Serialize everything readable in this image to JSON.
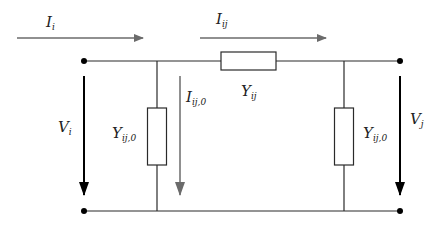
{
  "colors": {
    "wire": "#2a2a2a",
    "voltage_arrow": "#000000",
    "current_arrow": "#6b6b6b",
    "element_fill": "#ffffff"
  },
  "labels": {
    "current_in": {
      "main": "I",
      "sub": "i"
    },
    "current_series": {
      "main": "I",
      "sub": "ij"
    },
    "current_shunt": {
      "main": "I",
      "sub": "ij,0"
    },
    "series_admittance": {
      "main": "Y",
      "sub": "ij"
    },
    "shunt_admittance_left": {
      "main": "Y",
      "sub": "ij,0"
    },
    "shunt_admittance_right": {
      "main": "Y",
      "sub": "ij,0"
    },
    "voltage_left": {
      "main": "V",
      "sub": "i"
    },
    "voltage_right": {
      "main": "V",
      "sub": "j"
    }
  }
}
